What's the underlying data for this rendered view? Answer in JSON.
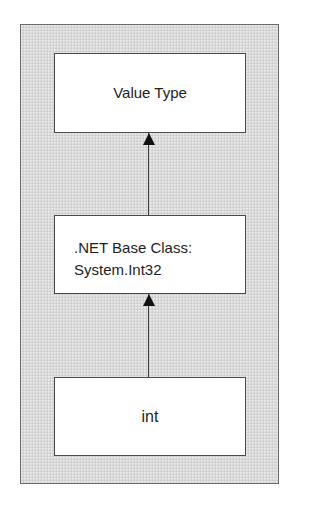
{
  "diagram": {
    "type": "inheritance-hierarchy",
    "direction": "bottom-to-top",
    "colors": {
      "frame_background": "#dadada",
      "frame_border": "#6a6a6a",
      "box_background": "#ffffff",
      "box_border": "#4a4a4a",
      "arrow": "#111111",
      "text": "#1e1e1e"
    },
    "nodes": [
      {
        "id": "value-type",
        "label": "Value Type"
      },
      {
        "id": "base-class",
        "lines": [
          ".NET Base Class:",
          "System.Int32"
        ]
      },
      {
        "id": "int",
        "label": "int"
      }
    ],
    "edges": [
      {
        "from": "base-class",
        "to": "value-type",
        "arrow": "filled-triangle"
      },
      {
        "from": "int",
        "to": "base-class",
        "arrow": "filled-triangle"
      }
    ]
  }
}
